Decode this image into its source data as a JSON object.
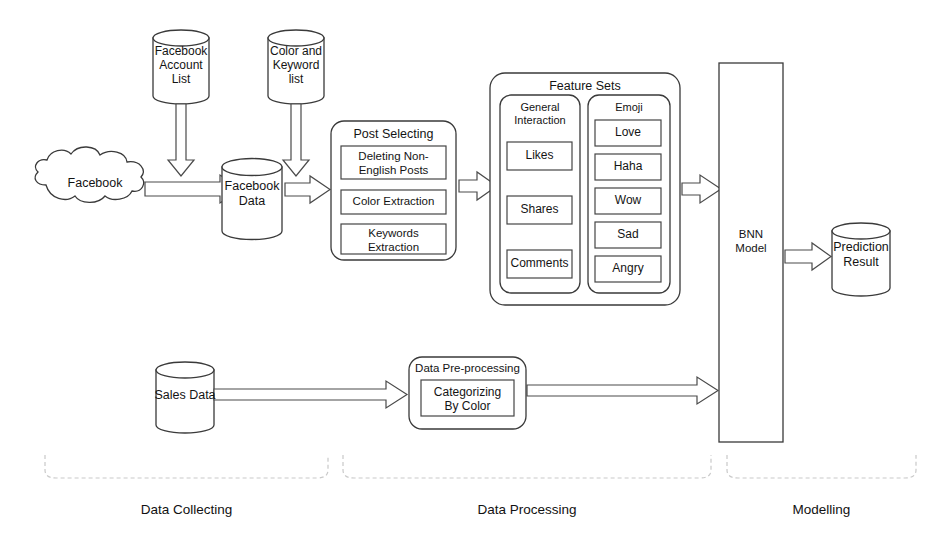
{
  "diagram": {
    "stroke_color": "#3a3a3a",
    "fill_color": "#ffffff",
    "background": "#ffffff"
  },
  "data_collecting": {
    "facebook_account_list": "Facebook\nAccount\nList",
    "color_keyword_list": "Color and\nKeyword\nlist",
    "facebook_cloud": "Facebook",
    "facebook_data": "Facebook\nData",
    "sales_data": "Sales Data"
  },
  "data_processing": {
    "post_selecting": {
      "title": "Post Selecting",
      "steps": [
        "Deleting Non-\nEnglish Posts",
        "Color Extraction",
        "Keywords\nExtraction"
      ]
    },
    "feature_sets": {
      "title": "Feature Sets",
      "groups": [
        {
          "title": "General\nInteraction",
          "items": [
            "Likes",
            "Shares",
            "Comments"
          ]
        },
        {
          "title": "Emoji",
          "items": [
            "Love",
            "Haha",
            "Wow",
            "Sad",
            "Angry"
          ]
        }
      ]
    },
    "data_preprocessing": {
      "title": "Data Pre-processing",
      "steps": [
        "Categorizing\nBy Color"
      ]
    }
  },
  "modelling": {
    "bnn_model": "BNN\nModel",
    "prediction_result": "Prediction\nResult"
  },
  "phases": [
    {
      "label": "Data Collecting"
    },
    {
      "label": "Data Processing"
    },
    {
      "label": "Modelling"
    }
  ]
}
